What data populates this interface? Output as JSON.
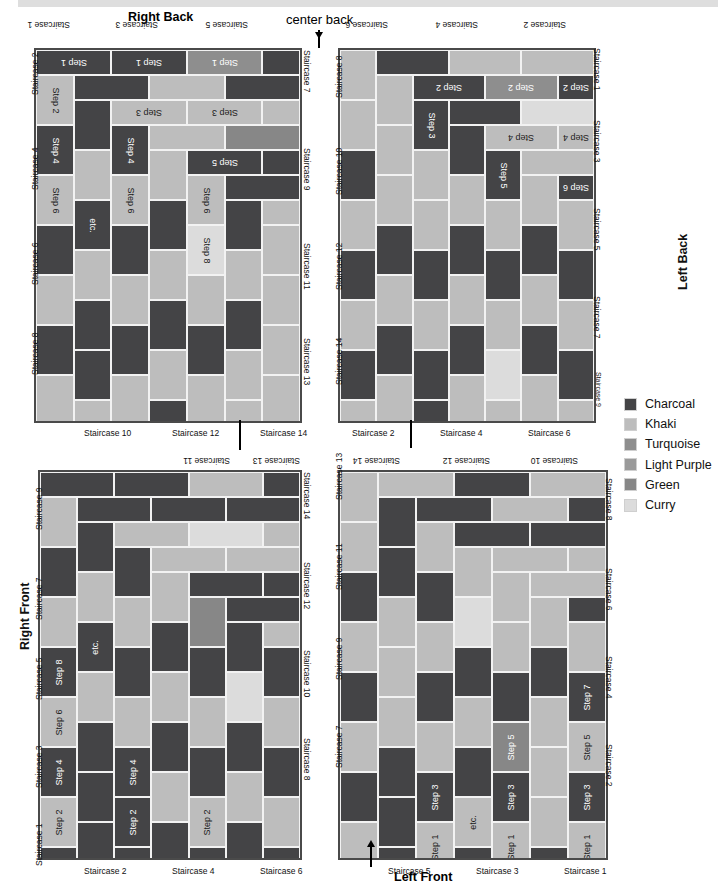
{
  "page": {
    "center_back_label": "center back",
    "left_front_label": "Left Front"
  },
  "legend": {
    "items": [
      {
        "name": "Charcoal",
        "color": "#444446",
        "key": "charcoal"
      },
      {
        "name": "Khaki",
        "color": "#bdbdbd",
        "key": "khaki"
      },
      {
        "name": "Turquoise",
        "color": "#8e8e8e",
        "key": "turquoise"
      },
      {
        "name": "Light Purple",
        "color": "#9a9a9a",
        "key": "lightpurple"
      },
      {
        "name": "Green",
        "color": "#878787",
        "key": "green"
      },
      {
        "name": "Curry",
        "color": "#dcdcdc",
        "key": "curry"
      }
    ]
  },
  "panels": {
    "right_back": {
      "title": "Right Back",
      "top_labels": [
        "Staircase 1",
        "Staircase 3",
        "Staircase 5"
      ],
      "bottom_labels": [
        "Staircase 10",
        "Staircase 12",
        "Staircase 14"
      ],
      "left_labels": [
        "Staircase 2",
        "Staircase 4",
        "Staircase 6",
        "Staircase 8"
      ],
      "right_labels": [
        "Staircase 7",
        "Staircase 9",
        "Staircase 11",
        "Staircase 13"
      ],
      "steps": [
        "Step 1",
        "Step 2",
        "Step 3",
        "Step 4",
        "Step 5",
        "Step 6",
        "Step 7",
        "Step 8",
        "etc."
      ]
    },
    "left_back": {
      "title": "Left Back",
      "top_labels": [
        "Staircase 6",
        "Staircase 4",
        "Staircase 2"
      ],
      "bottom_labels": [
        "Staircase 2",
        "Staircase 4",
        "Staircase 6"
      ],
      "left_labels": [
        "Staircase 8",
        "Staircase 10",
        "Staircase 12",
        "Staircase 14"
      ],
      "right_labels": [
        "Staircase 1",
        "Staircase 3",
        "Staircase 5",
        "Staircase 7",
        "Staircase 9"
      ],
      "steps": [
        "Step 1",
        "Step 2",
        "Step 3",
        "Step 4",
        "Step 5",
        "Step 6",
        "Step 7",
        "Step 8",
        "etc."
      ]
    },
    "right_front": {
      "title": "Right Front",
      "top_labels": [
        "Staircase 11",
        "Staircase 13"
      ],
      "bottom_labels": [
        "Staircase 2",
        "Staircase 4",
        "Staircase 6"
      ],
      "left_labels": [
        "Staircase 9",
        "Staircase 7",
        "Staircase 5",
        "Staircase 3",
        "Staircase 1"
      ],
      "right_labels": [
        "Staircase 14",
        "Staircase 12",
        "Staircase 10",
        "Staircase 8"
      ],
      "steps": [
        "Step 1",
        "Step 2",
        "Step 3",
        "Step 4",
        "Step 5",
        "Step 6",
        "Step 7",
        "Step 8",
        "etc."
      ]
    },
    "left_front": {
      "title": "Left Front",
      "top_labels": [
        "Staircase 14",
        "Staircase 12",
        "Staircase 10"
      ],
      "bottom_labels": [
        "Staircase 5",
        "Staircase 3",
        "Staircase 1"
      ],
      "left_labels": [
        "Staircase 13",
        "Staircase 11",
        "Staircase 9",
        "Staircase 7"
      ],
      "right_labels": [
        "Staircase 8",
        "Staircase 6",
        "Staircase 4",
        "Staircase 2"
      ],
      "steps": [
        "Step 1",
        "Step 2",
        "Step 3",
        "Step 4",
        "Step 5",
        "Step 6",
        "Step 7",
        "Step 8",
        "etc."
      ]
    }
  },
  "brick_layout": {
    "cols": 7,
    "rows": 15,
    "note": "offset running-bond basketweave of horizontal and vertical bricks"
  }
}
